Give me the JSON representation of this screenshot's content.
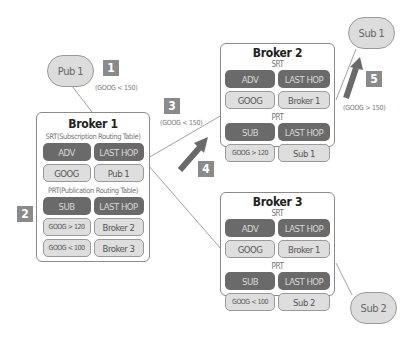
{
  "nodes": {
    "pub1": "Pub 1",
    "sub1": "Sub 1",
    "sub2": "Sub 2"
  },
  "steps": [
    {
      "num": "1",
      "condition": "(GOOG < 150)"
    },
    {
      "num": "2"
    },
    {
      "num": "3",
      "condition": "(GOOG < 150)"
    },
    {
      "num": "4"
    },
    {
      "num": "5",
      "condition": "(GOOG > 150)"
    }
  ],
  "brokers": [
    {
      "title": "Broker 1",
      "srt_label": "SRT(Subscription Routing Table)",
      "srt_headers": [
        "ADV",
        "LAST HOP"
      ],
      "srt_rows": [
        [
          "GOOG",
          "Pub 1"
        ]
      ],
      "prt_label": "PRT(Publication Routing Table)",
      "prt_headers": [
        "SUB",
        "LAST HOP"
      ],
      "prt_rows": [
        [
          "GOOG > 120",
          "Broker 2"
        ],
        [
          "GOOG < 100",
          "Broker 3"
        ]
      ]
    },
    {
      "title": "Broker 2",
      "srt_label": "SRT",
      "srt_headers": [
        "ADV",
        "LAST HOP"
      ],
      "srt_rows": [
        [
          "GOOG",
          "Broker 1"
        ]
      ],
      "prt_label": "PRT",
      "prt_headers": [
        "SUB",
        "LAST HOP"
      ],
      "prt_rows": [
        [
          "GOOG > 120",
          "Sub 1"
        ]
      ]
    },
    {
      "title": "Broker 3",
      "srt_label": "SRT",
      "srt_headers": [
        "ADV",
        "LAST HOP"
      ],
      "srt_rows": [
        [
          "GOOG",
          "Broker 1"
        ]
      ],
      "prt_label": "PRT",
      "prt_headers": [
        "SUB",
        "LAST HOP"
      ],
      "prt_rows": [
        [
          "GOOG < 100",
          "Sub 2"
        ]
      ]
    }
  ],
  "colors": {
    "header_cell": "#6a6a6a",
    "body_cell": "#dedede",
    "badge": "#8a8a8a",
    "arrow": "#6a6a6a"
  }
}
